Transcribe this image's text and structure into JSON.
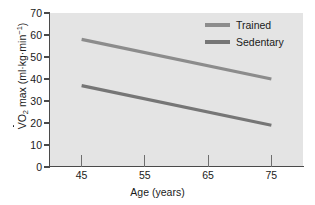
{
  "chart_data": {
    "type": "line",
    "title": "",
    "xlabel": "Age (years)",
    "ylabel": "VO2 max (ml·kg·min⁻¹)",
    "ylabel_parts": {
      "v": "V",
      "o": "O",
      "sub": "2",
      "mid": " max (ml·kg·min",
      "sup": "−1",
      "end": ")"
    },
    "x": [
      45,
      75
    ],
    "xlim": [
      40,
      80
    ],
    "ylim": [
      0,
      70
    ],
    "xticks": [
      45,
      55,
      65,
      75
    ],
    "xtick_labels": [
      "45",
      "55",
      "65",
      "75"
    ],
    "yticks": [
      0,
      10,
      20,
      30,
      40,
      50,
      60,
      70
    ],
    "ytick_labels": [
      "0",
      "10",
      "20",
      "30",
      "40",
      "50",
      "60",
      "70"
    ],
    "grid": false,
    "legend_position": "top-right",
    "series": [
      {
        "name": "Trained",
        "values": [
          58,
          40
        ],
        "color": "#8c8c8c"
      },
      {
        "name": "Sedentary",
        "values": [
          37,
          19
        ],
        "color": "#767676"
      }
    ]
  },
  "legend": {
    "items": [
      {
        "label": "Trained",
        "color": "#8c8c8c"
      },
      {
        "label": "Sedentary",
        "color": "#767676"
      }
    ]
  },
  "colors": {
    "plot_background": "#e4e4e4",
    "figure_background": "#ffffff",
    "axis": "#4a4a4a",
    "text": "#1a1a1a",
    "trained": "#8c8c8c",
    "sedentary": "#767676"
  }
}
